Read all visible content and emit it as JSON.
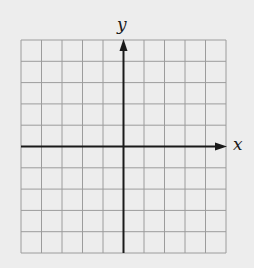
{
  "diagram": {
    "type": "coordinate-plane",
    "background_color": "#ededed",
    "grid": {
      "columns": 10,
      "rows": 10,
      "left": 21,
      "top": 40,
      "right": 226,
      "bottom": 253,
      "line_color": "#9c9c9c",
      "line_width": 1
    },
    "axes": {
      "color": "#1a1a1a",
      "width": 2,
      "x_axis": {
        "label": "x",
        "row_index": 5,
        "arrow": "right"
      },
      "y_axis": {
        "label": "y",
        "column_index": 5,
        "arrow": "up"
      }
    }
  }
}
